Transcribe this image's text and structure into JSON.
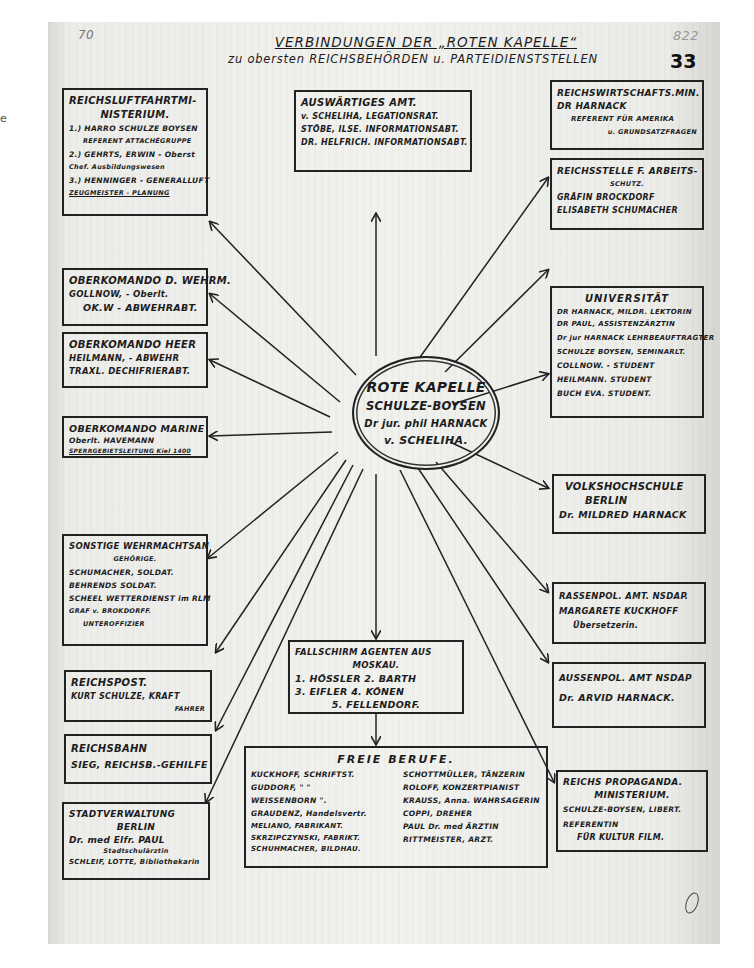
{
  "stray_mark": "e",
  "document": {
    "title": "VERBINDUNGEN DER „ROTEN KAPELLE“",
    "subtitle": "zu obersten REICHSBEHÖRDEN u. PARTEIDIENSTSTELLEN",
    "margin_number": "70",
    "archive_number": "822",
    "page_number": "33"
  },
  "hub": {
    "lines": [
      "ROTE KAPELLE",
      "SCHULZE-BOYSEN",
      "Dr jur. phil HARNACK",
      "v. SCHELIHA."
    ]
  },
  "nodes": {
    "luftfahrt": {
      "lines": [
        "REICHSLUFTFAHRTMI-",
        "NISTERIUM.",
        "1.) HARRO SCHULZE BOYSEN",
        "REFERENT ATTACHÉGRUPPE",
        "2.) GEHRTS, ERWIN - Oberst",
        "Chef. Ausbildungswesen",
        "3.) HENNINGER - GENERALLUFT",
        "ZEUGMEISTER - PLANUNG"
      ]
    },
    "auswaertiges": {
      "lines": [
        "AUSWÄRTIGES AMT.",
        "v. SCHELIHA, LEGATIONSRAT.",
        "STÖBE, ILSE. INFORMATIONSABT.",
        "DR. HELFRICH. INFORMATIONSABT."
      ]
    },
    "wirtschaft": {
      "lines": [
        "REICHSWIRTSCHAFTS.MIN.",
        "DR HARNACK",
        "REFERENT FÜR AMERIKA",
        "u. GRUNDSATZFRAGEN"
      ]
    },
    "arbeitsschutz": {
      "lines": [
        "REICHSSTELLE F. ARBEITS-",
        "SCHUTZ.",
        "GRÄFIN BROCKDORF",
        "ELISABETH SCHUMACHER"
      ]
    },
    "okw": {
      "lines": [
        "OBERKOMANDO D. WEHRM.",
        "GOLLNOW, - Oberlt.",
        "OK.W - ABWEHRABT."
      ]
    },
    "universitaet": {
      "lines": [
        "UNIVERSITÄT",
        "DR HARNACK, MILDR. LEKTORIN",
        "DR PAUL, ASSISTENZÄRZTIN",
        "Dr jur HARNACK LEHRBEAUFTRAGTER",
        "SCHULZE BOYSEN, SEMINARLT.",
        "COLLNOW. - STUDENT",
        "HEILMANN. STUDENT",
        "BUCH EVA. STUDENT."
      ]
    },
    "okh": {
      "lines": [
        "OBERKOMANDO HEER",
        "HEILMANN, - ABWEHR",
        "TRAXL. DECHIFRIERABT."
      ]
    },
    "okm": {
      "lines": [
        "OBERKOMANDO MARINE",
        "Oberlt. HAVEMANN",
        "SPERRGEBIETSLEITUNG Kiel 1400"
      ]
    },
    "volkshochschule": {
      "lines": [
        "VOLKSHOCHSCHULE",
        "BERLIN",
        "Dr. MILDRED HARNACK"
      ]
    },
    "wehrmacht_sonstige": {
      "lines": [
        "SONSTIGE WEHRMACHTSAN",
        "GEHÖRIGE.",
        "SCHUMACHER, SOLDAT.",
        "BEHRENDS SOLDAT.",
        "SCHEEL WETTERDIENST im RLM",
        "GRAF v. BROKDORFF.",
        "UNTEROFFIZIER"
      ]
    },
    "rassenpol": {
      "lines": [
        "RASSENPOL. AMT. NSDAP.",
        "MARGARETE KUCKHOFF",
        "Übersetzerin."
      ]
    },
    "aussenpol": {
      "lines": [
        "AUSSENPOL. AMT NSDAP",
        "Dr. ARVID HARNACK."
      ]
    },
    "reichspost": {
      "lines": [
        "REICHSPOST.",
        "KURT SCHULZE, KRAFT",
        "FAHRER"
      ]
    },
    "reichsbahn": {
      "lines": [
        "REICHSBAHN",
        "SIEG, REICHSB.-GEHILFE"
      ]
    },
    "fallschirm": {
      "lines": [
        "FALLSCHIRM AGENTEN AUS",
        "MOSKAU.",
        "1. HÖSSLER  2. BARTH",
        "3. EIFLER   4. KÖNEN",
        "5. FELLENDORF."
      ]
    },
    "propaganda": {
      "lines": [
        "REICHS PROPAGANDA.",
        "MINISTERIUM.",
        "SCHULZE-BOYSEN, LIBERT.",
        "REFERENTIN",
        "FÜR KULTUR FILM."
      ]
    },
    "stadtverwaltung": {
      "lines": [
        "STADTVERWALTUNG",
        "BERLIN",
        "Dr. med Elfr. PAUL",
        "Stadtschulärztin",
        "SCHLEIF, LOTTE, Bibliothekarin"
      ]
    },
    "freie_berufe": {
      "title": "FREIE   BERUFE.",
      "left": [
        "KUCKHOFF, SCHRIFTST.",
        "GUDDORF,  \"  \"",
        "WEISSENBORN  \".",
        "GRAUDENZ, Handelsvertr.",
        "MELIANO, FABRIKANT.",
        "SKRZIPCZYNSKI, FABRIKT.",
        "SCHUHMACHER, BILDHAU."
      ],
      "right": [
        "SCHOTTMÜLLER, TÄNZERIN",
        "ROLOFF, KONZERTPIANIST",
        "KRAUSS, Anna. WAHRSAGERIN",
        "COPPI, DREHER",
        "PAUL Dr. med ÄRZTIN",
        "RITTMEISTER, ARZT."
      ]
    }
  },
  "connections": [
    {
      "from": "hub",
      "to": "auswaertiges"
    },
    {
      "from": "hub",
      "to": "luftfahrt"
    },
    {
      "from": "hub",
      "to": "wirtschaft"
    },
    {
      "from": "hub",
      "to": "arbeitsschutz"
    },
    {
      "from": "hub",
      "to": "okw"
    },
    {
      "from": "hub",
      "to": "universitaet"
    },
    {
      "from": "hub",
      "to": "okh"
    },
    {
      "from": "hub",
      "to": "okm"
    },
    {
      "from": "hub",
      "to": "volkshochschule"
    },
    {
      "from": "hub",
      "to": "wehrmacht_sonstige"
    },
    {
      "from": "hub",
      "to": "rassenpol"
    },
    {
      "from": "hub",
      "to": "aussenpol"
    },
    {
      "from": "hub",
      "to": "reichspost"
    },
    {
      "from": "hub",
      "to": "reichsbahn"
    },
    {
      "from": "hub",
      "to": "stadtverwaltung"
    },
    {
      "from": "hub",
      "to": "fallschirm"
    },
    {
      "from": "fallschirm",
      "to": "freie_berufe"
    },
    {
      "from": "hub",
      "to": "propaganda"
    }
  ]
}
